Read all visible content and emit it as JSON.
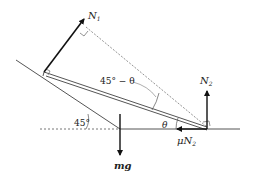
{
  "diagram": {
    "type": "free-body-diagram",
    "colors": {
      "line": "#555555",
      "arrow": "#111111",
      "dashed": "#777777",
      "text": "#222222"
    },
    "labels": {
      "n1": "N",
      "n1_sub": "1",
      "n2": "N",
      "n2_sub": "2",
      "friction_mu": "μ",
      "friction_n": "N",
      "friction_sub": "2",
      "weight": "mg",
      "angle_incline": "45°",
      "angle_theta": "θ",
      "angle_diff": "45° − θ"
    },
    "forces": [
      {
        "name": "N1",
        "direction": "perpendicular to incline, up-right"
      },
      {
        "name": "N2",
        "direction": "vertical up"
      },
      {
        "name": "μN2",
        "direction": "horizontal left"
      },
      {
        "name": "mg",
        "direction": "vertical down"
      }
    ]
  }
}
